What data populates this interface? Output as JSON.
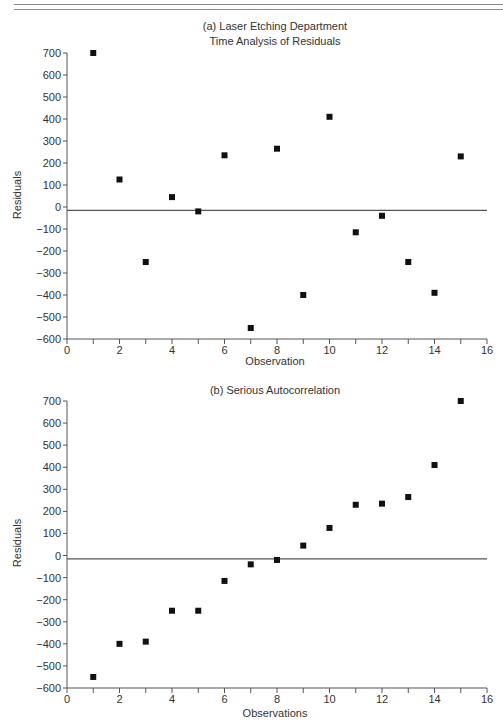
{
  "page": {
    "header_rules": 2
  },
  "chart_data": [
    {
      "type": "scatter",
      "title": "(a) Laser Etching Department",
      "subtitle": "Time Analysis of Residuals",
      "xlabel": "Observation",
      "ylabel": "Residuals",
      "xlim": [
        0,
        16
      ],
      "ylim": [
        -600,
        700
      ],
      "xticks": [
        0,
        2,
        4,
        6,
        8,
        10,
        12,
        14,
        16
      ],
      "xminor_ticks": [
        1,
        3,
        5,
        7,
        9,
        11,
        13,
        15
      ],
      "yticks": [
        700,
        600,
        500,
        400,
        300,
        200,
        100,
        0,
        -100,
        -200,
        -300,
        -400,
        -500,
        -600
      ],
      "ytick_labels": [
        "700",
        "600",
        "500",
        "400",
        "300",
        "200",
        "100",
        "0",
        "−100",
        "−200",
        "−300",
        "−400",
        "−500",
        "−600"
      ],
      "xtick_labels": [
        "0",
        "2",
        "4",
        "6",
        "8",
        "10",
        "12",
        "14",
        "16"
      ],
      "reference_line_y": -15,
      "grid": false,
      "legend": null,
      "marker": "square",
      "marker_color": "#111111",
      "x": [
        1,
        2,
        3,
        4,
        5,
        6,
        7,
        8,
        9,
        10,
        11,
        12,
        13,
        14,
        15
      ],
      "y": [
        700,
        125,
        -250,
        45,
        -20,
        235,
        -550,
        265,
        -400,
        410,
        -115,
        -40,
        -250,
        -390,
        230
      ]
    },
    {
      "type": "scatter",
      "title": "(b) Serious Autocorrelation",
      "subtitle": "",
      "xlabel": "Observations",
      "ylabel": "Residuals",
      "xlim": [
        0,
        16
      ],
      "ylim": [
        -600,
        700
      ],
      "xticks": [
        0,
        2,
        4,
        6,
        8,
        10,
        12,
        14,
        16
      ],
      "xminor_ticks": [
        1,
        3,
        5,
        7,
        9,
        11,
        13,
        15
      ],
      "yticks": [
        700,
        600,
        500,
        400,
        300,
        200,
        100,
        0,
        -100,
        -200,
        -300,
        -400,
        -500,
        -600
      ],
      "ytick_labels": [
        "700",
        "600",
        "500",
        "400",
        "300",
        "200",
        "100",
        "0",
        "−100",
        "−200",
        "−300",
        "−400",
        "−500",
        "−600"
      ],
      "xtick_labels": [
        "0",
        "2",
        "4",
        "6",
        "8",
        "10",
        "12",
        "14",
        "16"
      ],
      "reference_line_y": -15,
      "grid": false,
      "legend": null,
      "marker": "square",
      "marker_color": "#111111",
      "x": [
        1,
        2,
        3,
        4,
        5,
        6,
        7,
        8,
        9,
        10,
        11,
        12,
        13,
        14,
        15
      ],
      "y": [
        -550,
        -400,
        -390,
        -250,
        -250,
        -115,
        -40,
        -20,
        45,
        125,
        230,
        235,
        265,
        410,
        700
      ]
    }
  ],
  "layout": {
    "charts": [
      {
        "x0": 67,
        "x1": 487,
        "y_top": 53,
        "y_bottom": 339,
        "title_y": 30,
        "subtitle_y": 45,
        "xlabel_y": 365,
        "ylabel_x": 20,
        "ylabel_y": 195
      },
      {
        "x0": 67,
        "x1": 487,
        "y_top": 401,
        "y_bottom": 688,
        "title_y": 394,
        "subtitle_y": 0,
        "xlabel_y": 717,
        "ylabel_x": 20,
        "ylabel_y": 543
      }
    ],
    "colors": {
      "axis": "#555555",
      "text": "#333333",
      "marker": "#111111"
    }
  }
}
